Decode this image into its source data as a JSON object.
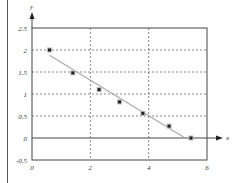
{
  "chart_data": {
    "type": "scatter",
    "title": "",
    "xlabel": "x",
    "ylabel": "y",
    "xlim": [
      0,
      6
    ],
    "ylim": [
      -0.5,
      2.5
    ],
    "grid": true,
    "legend": null,
    "x_ticks": [
      "0",
      "2",
      "4",
      "6"
    ],
    "y_ticks": [
      "2.5",
      "2",
      "1.5",
      "1",
      "0.5",
      "0",
      "-0.5"
    ],
    "series": [
      {
        "name": "data points",
        "type": "scatter",
        "marker": "filled-square-star",
        "x": [
          0.6,
          1.4,
          2.3,
          3.0,
          3.8,
          4.7,
          5.45
        ],
        "y": [
          2.0,
          1.48,
          1.1,
          0.82,
          0.56,
          0.27,
          0.0
        ]
      },
      {
        "name": "fitted line",
        "type": "line",
        "color": "#aaaaaa",
        "x": [
          0.6,
          5.25
        ],
        "y": [
          1.88,
          0.0
        ]
      }
    ]
  },
  "colors": {
    "frame": "#444444",
    "grid": "#555555",
    "fit_line": "#aaaaaa",
    "marker": "#222222"
  }
}
